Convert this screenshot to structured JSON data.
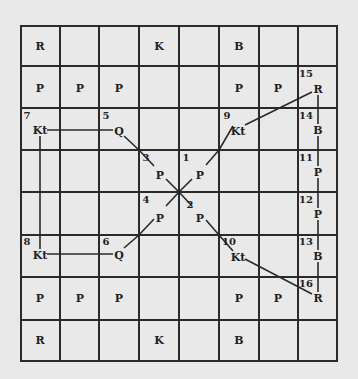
{
  "diagram": {
    "type": "chess-like board diagram with numbered move paths",
    "grid": {
      "columns": 8,
      "rows": 8
    },
    "colors": {
      "background": "#e9e9e9",
      "lines": "#2a2a2a",
      "text": "#1e1e1e"
    },
    "static_pieces": [
      {
        "label": "R",
        "x": 40,
        "y": 46
      },
      {
        "label": "K",
        "x": 159,
        "y": 46
      },
      {
        "label": "B",
        "x": 239,
        "y": 46
      },
      {
        "label": "P",
        "x": 40,
        "y": 88
      },
      {
        "label": "P",
        "x": 80,
        "y": 88
      },
      {
        "label": "P",
        "x": 119,
        "y": 88
      },
      {
        "label": "P",
        "x": 239,
        "y": 88
      },
      {
        "label": "P",
        "x": 278,
        "y": 88
      },
      {
        "label": "P",
        "x": 40,
        "y": 298
      },
      {
        "label": "P",
        "x": 80,
        "y": 298
      },
      {
        "label": "P",
        "x": 119,
        "y": 298
      },
      {
        "label": "P",
        "x": 239,
        "y": 298
      },
      {
        "label": "P",
        "x": 278,
        "y": 298
      },
      {
        "label": "R",
        "x": 40,
        "y": 340
      },
      {
        "label": "K",
        "x": 159,
        "y": 340
      },
      {
        "label": "B",
        "x": 239,
        "y": 340
      }
    ],
    "numbered_pieces": [
      {
        "num": "1",
        "label": "P",
        "num_x": 186,
        "num_y": 158,
        "x": 200,
        "y": 175
      },
      {
        "num": "2",
        "label": "P",
        "num_x": 190,
        "num_y": 205,
        "x": 200,
        "y": 218
      },
      {
        "num": "3",
        "label": "P",
        "num_x": 146,
        "num_y": 158,
        "x": 160,
        "y": 175
      },
      {
        "num": "4",
        "label": "P",
        "num_x": 146,
        "num_y": 200,
        "x": 160,
        "y": 218
      },
      {
        "num": "5",
        "label": "Q",
        "num_x": 106,
        "num_y": 116,
        "x": 119,
        "y": 131
      },
      {
        "num": "6",
        "label": "Q",
        "num_x": 106,
        "num_y": 242,
        "x": 119,
        "y": 255
      },
      {
        "num": "7",
        "label": "Kt",
        "num_x": 27,
        "num_y": 116,
        "x": 40,
        "y": 130
      },
      {
        "num": "8",
        "label": "Kt",
        "num_x": 27,
        "num_y": 242,
        "x": 40,
        "y": 255
      },
      {
        "num": "9",
        "label": "Kt",
        "num_x": 227,
        "num_y": 116,
        "x": 238,
        "y": 131
      },
      {
        "num": "10",
        "label": "Kt",
        "num_x": 229,
        "num_y": 242,
        "x": 238,
        "y": 257
      },
      {
        "num": "11",
        "label": "P",
        "num_x": 306,
        "num_y": 158,
        "x": 318,
        "y": 172
      },
      {
        "num": "12",
        "label": "P",
        "num_x": 306,
        "num_y": 200,
        "x": 318,
        "y": 214
      },
      {
        "num": "13",
        "label": "B",
        "num_x": 306,
        "num_y": 242,
        "x": 318,
        "y": 256
      },
      {
        "num": "14",
        "label": "B",
        "num_x": 306,
        "num_y": 116,
        "x": 318,
        "y": 130
      },
      {
        "num": "15",
        "label": "R",
        "num_x": 306,
        "num_y": 74,
        "x": 318,
        "y": 89
      },
      {
        "num": "16",
        "label": "R",
        "num_x": 306,
        "num_y": 284,
        "x": 318,
        "y": 298
      }
    ]
  }
}
